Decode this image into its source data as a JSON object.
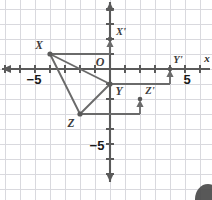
{
  "figure": {
    "type": "coordinate-plane-translation",
    "title": "",
    "origin_label": "O",
    "axis_labels": {
      "x": "x",
      "y": "y"
    },
    "axis_tick_labels": {
      "x_negative": "−5",
      "x_positive": "5",
      "y_negative": "−5"
    },
    "grid": {
      "spacing_units": 1,
      "x_range": [
        -7,
        6
      ],
      "y_range": [
        -8,
        5
      ],
      "visible": true,
      "grid_color": "#d8d8dc",
      "axis_color": "#5a5a5a"
    },
    "preimage": {
      "name": "triangle-XYZ",
      "fill": "none",
      "stroke": "#5a5a5a",
      "vertices": [
        {
          "label": "X",
          "x": -4,
          "y": 1
        },
        {
          "label": "Y",
          "x": 0,
          "y": -1
        },
        {
          "label": "Z",
          "x": -2,
          "y": -3
        }
      ]
    },
    "image": {
      "name": "triangle-X'Y'Z'",
      "stroke": "#5a5a5a",
      "vertices": [
        {
          "label": "X'",
          "x": 0,
          "y": 2
        },
        {
          "label": "Y'",
          "x": 4,
          "y": 0
        },
        {
          "label": "Z'",
          "x": 2,
          "y": -2
        }
      ]
    },
    "translation_vector": {
      "dx": 4,
      "dy": 1
    },
    "connectors": [
      {
        "name": "connector-X",
        "from_x": -4,
        "from_y": 1,
        "to_x": 0,
        "to_y": 1
      },
      {
        "name": "connector-Y",
        "from_x": 0,
        "from_y": -1,
        "to_x": 4,
        "to_y": -1
      },
      {
        "name": "connector-Z",
        "from_x": -2,
        "from_y": -3,
        "to_x": 2,
        "to_y": -3
      }
    ],
    "arrows": [
      {
        "name": "arrow-to-X-prime",
        "x": 0,
        "from_y": 1,
        "to_y": 2
      },
      {
        "name": "arrow-to-Y-prime",
        "x": 4,
        "from_y": -1,
        "to_y": 0
      },
      {
        "name": "arrow-to-Z-prime",
        "x": 2,
        "from_y": -3,
        "to_y": -2
      }
    ]
  }
}
